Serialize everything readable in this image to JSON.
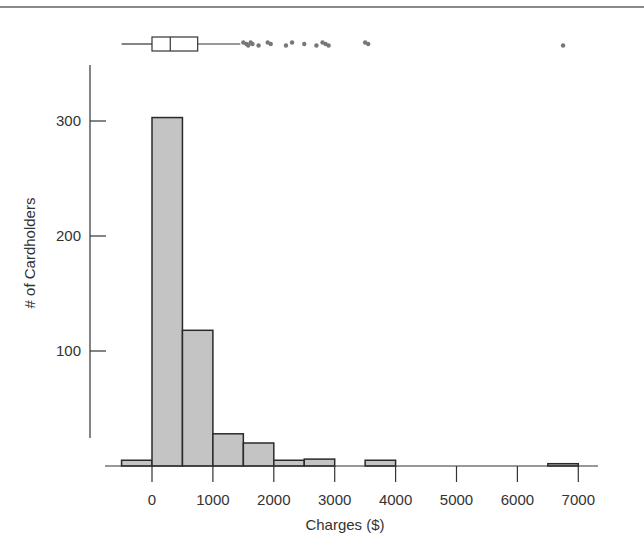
{
  "chart_data": {
    "type": "bar",
    "subtype": "histogram_with_boxplot",
    "title": "",
    "xlabel": "Charges ($)",
    "ylabel": "# of Cardholders",
    "bin_width": 500,
    "bins": [
      {
        "start": -500,
        "end": 0,
        "count": 5
      },
      {
        "start": 0,
        "end": 500,
        "count": 303
      },
      {
        "start": 500,
        "end": 1000,
        "count": 118
      },
      {
        "start": 1000,
        "end": 1500,
        "count": 28
      },
      {
        "start": 1500,
        "end": 2000,
        "count": 20
      },
      {
        "start": 2000,
        "end": 2500,
        "count": 5
      },
      {
        "start": 2500,
        "end": 3000,
        "count": 6
      },
      {
        "start": 3000,
        "end": 3500,
        "count": 0
      },
      {
        "start": 3500,
        "end": 4000,
        "count": 5
      },
      {
        "start": 4000,
        "end": 6500,
        "count": 0
      },
      {
        "start": 6500,
        "end": 7000,
        "count": 2
      }
    ],
    "categories": [
      "-500–0",
      "0–500",
      "500–1000",
      "1000–1500",
      "1500–2000",
      "2000–2500",
      "2500–3000",
      "3000–3500",
      "3500–4000",
      "6500–7000"
    ],
    "values": [
      5,
      303,
      118,
      28,
      20,
      5,
      6,
      0,
      5,
      2
    ],
    "x_ticks": [
      0,
      1000,
      2000,
      3000,
      4000,
      5000,
      6000,
      7000
    ],
    "x_tick_labels": [
      "0",
      "1000",
      "2000",
      "3000",
      "4000",
      "5000",
      "6000",
      "7000"
    ],
    "y_ticks": [
      100,
      200,
      300
    ],
    "y_tick_labels": [
      "100",
      "200",
      "300"
    ],
    "xlim": [
      -500,
      7000
    ],
    "ylim": [
      0,
      330
    ],
    "grid": false,
    "legend": null,
    "boxplot": {
      "whisker_low": -500,
      "q1": 0,
      "median": 300,
      "q3": 750,
      "whisker_high": 1450,
      "outliers": [
        1500,
        1550,
        1580,
        1620,
        1650,
        1750,
        1900,
        1950,
        2200,
        2300,
        2500,
        2700,
        2800,
        2850,
        2900,
        3500,
        3550,
        6750
      ]
    }
  },
  "colors": {
    "bar_fill": "#c4c4c4",
    "bar_stroke": "#2a2a2a",
    "axis": "#333333",
    "outlier": "#777777"
  }
}
